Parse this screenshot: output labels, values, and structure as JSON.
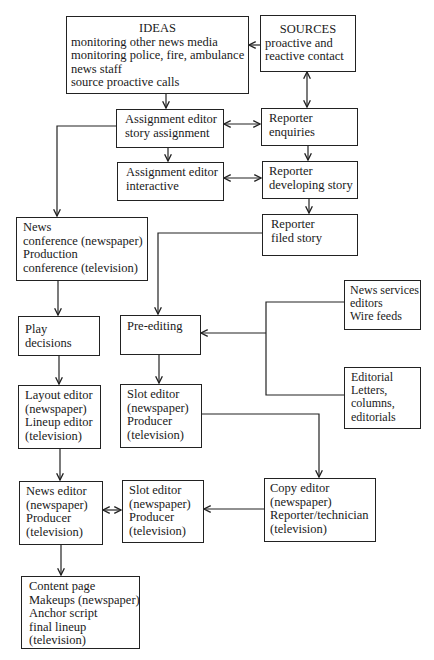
{
  "diagram": {
    "type": "flowchart",
    "topic": "News production workflow (newspaper and television)",
    "nodes": {
      "ideas": {
        "title": "IDEAS",
        "lines": [
          "monitoring other news media",
          "monitoring police, fire, ambulance",
          "news staff",
          "source proactive calls"
        ]
      },
      "sources": {
        "title": "SOURCES",
        "lines": [
          "proactive and",
          "reactive contact"
        ]
      },
      "assign_story": {
        "lines": [
          "Assignment editor",
          "story assignment"
        ]
      },
      "reporter_enquiries": {
        "lines": [
          "Reporter",
          "enquiries"
        ]
      },
      "assign_interactive": {
        "lines": [
          "Assignment editor",
          "interactive"
        ]
      },
      "reporter_developing": {
        "lines": [
          "Reporter",
          "developing story"
        ]
      },
      "reporter_filed": {
        "lines": [
          "Reporter",
          "filed story"
        ]
      },
      "news_conference": {
        "lines": [
          "News",
          "conference (newspaper)",
          "Production",
          "conference (television)"
        ]
      },
      "news_services": {
        "lines": [
          "News services",
          "editors",
          "Wire feeds"
        ]
      },
      "play_decisions": {
        "lines": [
          "Play",
          "decisions"
        ]
      },
      "pre_editing": {
        "lines": [
          "Pre-editing"
        ]
      },
      "editorial": {
        "lines": [
          "Editorial",
          "Letters,",
          "columns,",
          "editorials"
        ]
      },
      "layout_editor": {
        "lines": [
          "Layout editor",
          "(newspaper)",
          "Lineup editor",
          "(television)"
        ]
      },
      "slot_editor_1": {
        "lines": [
          "Slot editor",
          "(newspaper)",
          "Producer",
          "(television)"
        ]
      },
      "news_editor": {
        "lines": [
          "News editor",
          "(newspaper)",
          "Producer",
          "(television)"
        ]
      },
      "slot_editor_2": {
        "lines": [
          "Slot editor",
          "(newspaper)",
          "Producer",
          "(television)"
        ]
      },
      "copy_editor": {
        "lines": [
          "Copy editor",
          "(newspaper)",
          "Reporter/technician",
          "(television)"
        ]
      },
      "content_page": {
        "lines": [
          "Content page",
          "Makeups (newspaper)",
          "Anchor script",
          "final lineup",
          "(television)"
        ]
      }
    },
    "edges": [
      {
        "from": "sources",
        "to": "ideas",
        "direction": "forward"
      },
      {
        "from": "sources",
        "to": "reporter_enquiries",
        "direction": "both"
      },
      {
        "from": "ideas",
        "to": "assign_story",
        "direction": "forward"
      },
      {
        "from": "assign_story",
        "to": "reporter_enquiries",
        "direction": "both"
      },
      {
        "from": "assign_story",
        "to": "assign_interactive",
        "direction": "forward"
      },
      {
        "from": "reporter_enquiries",
        "to": "reporter_developing",
        "direction": "forward"
      },
      {
        "from": "assign_interactive",
        "to": "reporter_developing",
        "direction": "both"
      },
      {
        "from": "reporter_developing",
        "to": "reporter_filed",
        "direction": "forward"
      },
      {
        "from": "assign_story",
        "to": "news_conference",
        "direction": "forward"
      },
      {
        "from": "reporter_filed",
        "to": "pre_editing",
        "direction": "forward"
      },
      {
        "from": "news_services",
        "to": "pre_editing",
        "direction": "forward"
      },
      {
        "from": "editorial",
        "to": "pre_editing",
        "direction": "forward"
      },
      {
        "from": "news_conference",
        "to": "play_decisions",
        "direction": "forward"
      },
      {
        "from": "play_decisions",
        "to": "layout_editor",
        "direction": "forward"
      },
      {
        "from": "pre_editing",
        "to": "slot_editor_1",
        "direction": "forward"
      },
      {
        "from": "slot_editor_1",
        "to": "copy_editor",
        "direction": "forward"
      },
      {
        "from": "layout_editor",
        "to": "news_editor",
        "direction": "forward"
      },
      {
        "from": "copy_editor",
        "to": "slot_editor_2",
        "direction": "forward"
      },
      {
        "from": "news_editor",
        "to": "slot_editor_2",
        "direction": "both"
      },
      {
        "from": "news_editor",
        "to": "content_page",
        "direction": "forward"
      }
    ]
  },
  "colors": {
    "ink": "#222222",
    "background": "#ffffff"
  }
}
